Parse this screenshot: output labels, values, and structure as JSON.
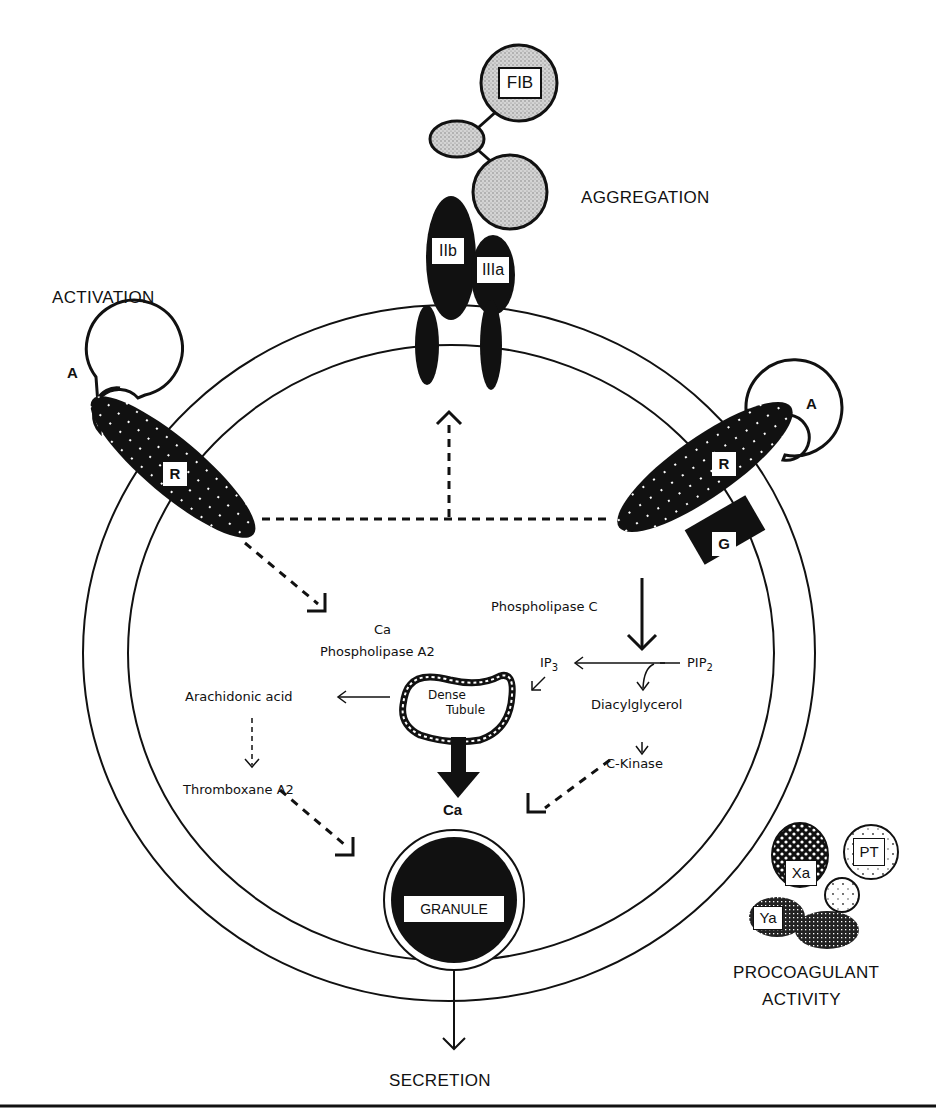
{
  "sections": {
    "activation": "ACTIVATION",
    "aggregation": "AGGREGATION",
    "secretion": "SECRETION",
    "procoagulant_line1": "PROCOAGULANT",
    "procoagulant_line2": "ACTIVITY"
  },
  "components": {
    "fibrinogen": "FIB",
    "gp_iib": "IIb",
    "gp_iiia": "IIIa",
    "agonist_left": "A",
    "agonist_right": "A",
    "receptor_left": "R",
    "receptor_right": "R",
    "g_protein": "G",
    "granule": "GRANULE",
    "dense_tubule_line1": "Dense",
    "dense_tubule_line2": "Tubule",
    "factor_xa": "Xa",
    "factor_ya": "Ya",
    "prothrombin": "PT"
  },
  "pathway": {
    "phospholipase_c": "Phospholipase C",
    "ca_label": "Ca",
    "phospholipase_a2": "Phospholipase A2",
    "ip3": "IP",
    "ip3_sub": "3",
    "pip2": "PIP",
    "pip2_sub": "2",
    "diacylglycerol": "Diacylglycerol",
    "c_kinase": "C-Kinase",
    "arachidonic_acid": "Arachidonic acid",
    "thromboxane_a2": "Thromboxane A2",
    "ca_release": "Ca"
  },
  "colors": {
    "ink": "#111111",
    "fib_fill": "#c8c8c8",
    "background": "#ffffff"
  }
}
